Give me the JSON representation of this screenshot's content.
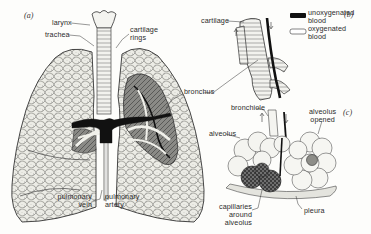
{
  "figure": {
    "panels": [
      {
        "id": "a",
        "label": "(a)"
      },
      {
        "id": "b",
        "label": "(b)"
      },
      {
        "id": "c",
        "label": "(c)"
      }
    ]
  },
  "panel_a": {
    "larynx": "larynx",
    "trachea": "trachea",
    "cartilage_rings_line1": "cartilage",
    "cartilage_rings_line2": "rings",
    "bronchus": "bronchus",
    "pulmonary_vein_line1": "pulmonary",
    "pulmonary_vein_line2": "vein",
    "pulmonary_artery_line1": "pulmonary",
    "pulmonary_artery_line2": "artery"
  },
  "panel_b": {
    "cartilage": "cartilage",
    "legend": [
      {
        "swatch": "filled-black",
        "line1": "unoxygenated",
        "line2": "blood"
      },
      {
        "swatch": "outline-white",
        "line1": "oxygenated",
        "line2": "blood"
      }
    ]
  },
  "panel_c": {
    "bronchiole": "bronchiole",
    "alveolus": "alveolus",
    "alveolus_opened_line1": "alveolus",
    "alveolus_opened_line2": "opened",
    "capillaries_line1": "capillaries",
    "capillaries_line2": "around alveolus",
    "pleura": "pleura"
  },
  "colors": {
    "ink": "#2b2b2b",
    "paper": "#fdfdfb",
    "vessel": "#111111",
    "tissue": "#e9e9e4"
  }
}
